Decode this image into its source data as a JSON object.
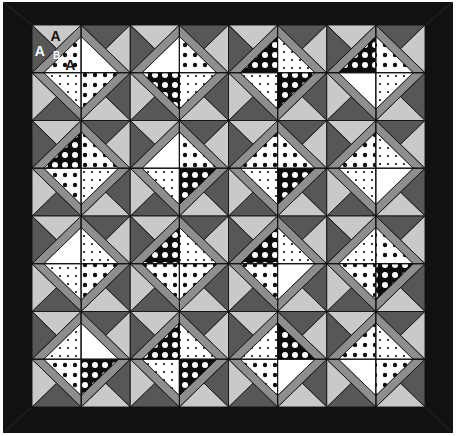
{
  "quilt": {
    "title": "Quilt layout diagram",
    "rows": 4,
    "cols": 4,
    "colors": {
      "background": "#ffffff",
      "border": "#111111",
      "border_miter": "#2a2a2a",
      "light_triangle": "#c9c9c9",
      "dark_triangle": "#575757",
      "band": "#8e8e8e",
      "line": "#111111",
      "fabric_white": "#ffffff",
      "fabric_black": "#0c0c0c",
      "dot_dark": "#111111",
      "dot_light": "#ffffff"
    },
    "outer": {
      "x": 3,
      "y": 2,
      "w": 450,
      "h": 431
    },
    "inner": {
      "x": 32,
      "y": 25,
      "w": 393,
      "h": 382
    },
    "band_ratio": 0.24,
    "piece_labels": [
      {
        "text": "A",
        "block": [
          0,
          0
        ],
        "pos": "top-corner",
        "color": "#111111"
      },
      {
        "text": "A",
        "block": [
          0,
          0
        ],
        "pos": "left-corner",
        "color": "#ffffff"
      },
      {
        "text": "B",
        "block": [
          0,
          0
        ],
        "pos": "band",
        "color": "#ffffff"
      },
      {
        "text": "A",
        "block": [
          0,
          0
        ],
        "pos": "center",
        "color": "#111111"
      }
    ],
    "fabric_legend": {
      "W": "white",
      "S": "small dots",
      "M": "medium dots",
      "K": "black with white dots"
    },
    "blocks": [
      [
        {
          "tl": "M",
          "tr": "W",
          "bl": "S",
          "br": "M"
        },
        {
          "tl": "W",
          "tr": "M",
          "bl": "K",
          "br": "S"
        },
        {
          "tl": "K",
          "tr": "S",
          "bl": "S",
          "br": "K"
        },
        {
          "tl": "K",
          "tr": "M",
          "bl": "W",
          "br": "S"
        }
      ],
      [
        {
          "tl": "K",
          "tr": "M",
          "bl": "M",
          "br": "S"
        },
        {
          "tl": "W",
          "tr": "M",
          "bl": "S",
          "br": "K"
        },
        {
          "tl": "M",
          "tr": "M",
          "bl": "S",
          "br": "K"
        },
        {
          "tl": "M",
          "tr": "S",
          "bl": "S",
          "br": "W"
        }
      ],
      [
        {
          "tl": "W",
          "tr": "S",
          "bl": "S",
          "br": "M"
        },
        {
          "tl": "K",
          "tr": "S",
          "bl": "M",
          "br": "M"
        },
        {
          "tl": "K",
          "tr": "S",
          "bl": "M",
          "br": "W"
        },
        {
          "tl": "S",
          "tr": "M",
          "bl": "M",
          "br": "K"
        }
      ],
      [
        {
          "tl": "S",
          "tr": "W",
          "bl": "M",
          "br": "K"
        },
        {
          "tl": "K",
          "tr": "S",
          "bl": "S",
          "br": "K"
        },
        {
          "tl": "S",
          "tr": "K",
          "bl": "M",
          "br": "W"
        },
        {
          "tl": "M",
          "tr": "S",
          "bl": "W",
          "br": "M"
        }
      ]
    ]
  }
}
